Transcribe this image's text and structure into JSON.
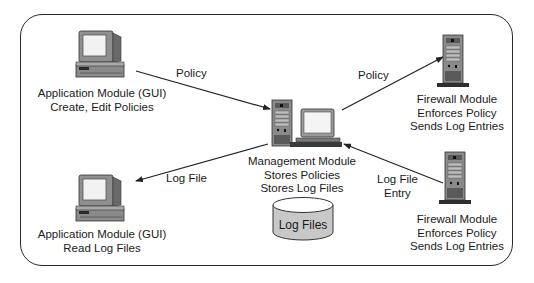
{
  "diagram": {
    "nodes": {
      "app_create": {
        "icon": "desktop-computer-icon",
        "lines": [
          "Application Module (GUI)",
          "Create, Edit Policies"
        ]
      },
      "app_read": {
        "icon": "desktop-computer-icon",
        "lines": [
          "Application Module (GUI)",
          "Read Log Files"
        ]
      },
      "management": {
        "icon": "server-with-monitor-icon",
        "lines": [
          "Management Module",
          "Stores Policies",
          "Stores Log Files"
        ]
      },
      "firewall_top": {
        "icon": "tower-server-icon",
        "lines": [
          "Firewall Module",
          "Enforces Policy",
          "Sends Log Entries"
        ]
      },
      "firewall_bottom": {
        "icon": "tower-server-icon",
        "lines": [
          "Firewall Module",
          "Enforces Policy",
          "Sends Log Entries"
        ]
      },
      "log_store": {
        "icon": "database-cylinder-icon",
        "label": "Log Files"
      }
    },
    "edges": {
      "app_to_mgmt": {
        "from": "app_create",
        "to": "management",
        "label": "Policy"
      },
      "mgmt_to_fw_top": {
        "from": "management",
        "to": "firewall_top",
        "label": "Policy"
      },
      "mgmt_to_app_read": {
        "from": "management",
        "to": "app_read",
        "label": "Log File"
      },
      "fw_bottom_to_mgmt": {
        "from": "firewall_bottom",
        "to": "management",
        "lines": [
          "Log File",
          "Entry"
        ]
      }
    },
    "colors": {
      "line": "#222222",
      "device_gray": "#8a8a8a",
      "device_dark": "#3a3a3a",
      "screen": "#f4f4f4",
      "db_fill": "#c8c8c8"
    }
  }
}
